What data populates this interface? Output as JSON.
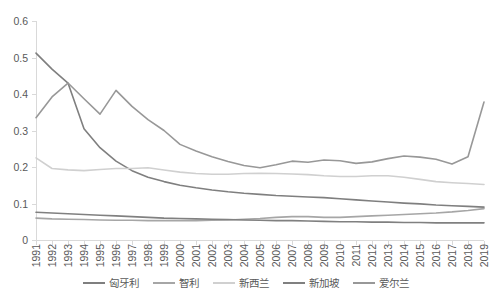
{
  "chart_data": {
    "type": "line",
    "title": "",
    "subtitle": "",
    "xlabel": "",
    "ylabel": "",
    "xlim": [
      1991,
      2019
    ],
    "ylim": [
      0,
      0.6
    ],
    "grid": false,
    "legend_position": "bottom",
    "y_ticks": [
      "0",
      "0.1",
      "0.2",
      "0.3",
      "0.4",
      "0.5",
      "0.6"
    ],
    "y_tick_values": [
      0,
      0.1,
      0.2,
      0.3,
      0.4,
      0.5,
      0.6
    ],
    "categories": [
      "1991",
      "1992",
      "1993",
      "1994",
      "1995",
      "1996",
      "1997",
      "1998",
      "1999",
      "2000",
      "2001",
      "2002",
      "2003",
      "2004",
      "2005",
      "2006",
      "2007",
      "2008",
      "2009",
      "2010",
      "2011",
      "2012",
      "2013",
      "2014",
      "2015",
      "2016",
      "2017",
      "2018",
      "2019"
    ],
    "series": [
      {
        "name": "匈牙利",
        "color": "#7f7f7f",
        "values": [
          0.512,
          0.468,
          0.43,
          0.305,
          0.253,
          0.216,
          0.19,
          0.172,
          0.16,
          0.15,
          0.143,
          0.137,
          0.132,
          0.128,
          0.125,
          0.122,
          0.12,
          0.118,
          0.116,
          0.113,
          0.11,
          0.107,
          0.104,
          0.101,
          0.099,
          0.096,
          0.094,
          0.092,
          0.09
        ]
      },
      {
        "name": "智利",
        "color": "#a6a6a6",
        "values": [
          0.06,
          0.058,
          0.057,
          0.056,
          0.055,
          0.054,
          0.054,
          0.053,
          0.053,
          0.053,
          0.053,
          0.054,
          0.055,
          0.057,
          0.059,
          0.062,
          0.064,
          0.064,
          0.062,
          0.062,
          0.064,
          0.066,
          0.068,
          0.07,
          0.072,
          0.074,
          0.077,
          0.081,
          0.086
        ]
      },
      {
        "name": "新西兰",
        "color": "#d0d0d0",
        "values": [
          0.225,
          0.196,
          0.192,
          0.19,
          0.193,
          0.196,
          0.196,
          0.198,
          0.192,
          0.186,
          0.182,
          0.18,
          0.18,
          0.182,
          0.183,
          0.182,
          0.181,
          0.179,
          0.176,
          0.174,
          0.174,
          0.176,
          0.176,
          0.172,
          0.166,
          0.16,
          0.157,
          0.155,
          0.152
        ]
      },
      {
        "name": "新加坡",
        "color": "#808080",
        "values": [
          0.076,
          0.074,
          0.072,
          0.07,
          0.068,
          0.066,
          0.064,
          0.062,
          0.06,
          0.059,
          0.058,
          0.057,
          0.056,
          0.055,
          0.054,
          0.053,
          0.053,
          0.052,
          0.051,
          0.05,
          0.05,
          0.049,
          0.049,
          0.048,
          0.048,
          0.047,
          0.047,
          0.047,
          0.047
        ]
      },
      {
        "name": "爱尔兰",
        "color": "#989898",
        "values": [
          0.335,
          0.392,
          0.43,
          0.387,
          0.345,
          0.41,
          0.366,
          0.33,
          0.3,
          0.262,
          0.244,
          0.228,
          0.215,
          0.204,
          0.198,
          0.206,
          0.216,
          0.213,
          0.219,
          0.217,
          0.21,
          0.214,
          0.223,
          0.23,
          0.227,
          0.221,
          0.208,
          0.228,
          0.378
        ]
      }
    ],
    "legend": [
      {
        "label": "匈牙利",
        "color": "#7f7f7f"
      },
      {
        "label": "智利",
        "color": "#a6a6a6"
      },
      {
        "label": "新西兰",
        "color": "#d0d0d0"
      },
      {
        "label": "新加坡",
        "color": "#808080"
      },
      {
        "label": "爱尔兰",
        "color": "#989898"
      }
    ]
  },
  "colors": {
    "axis": "#d9d9d9",
    "tick_text": "#595959",
    "background": "#ffffff"
  }
}
